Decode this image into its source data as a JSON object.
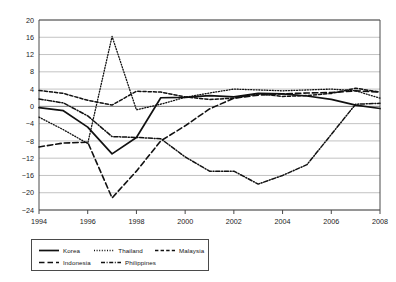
{
  "chart_data": {
    "type": "line",
    "title": "",
    "subtitle": "",
    "xlabel": "",
    "ylabel": "",
    "xlim": [
      1994,
      2008
    ],
    "ylim": [
      -24,
      20
    ],
    "grid": true,
    "legend_position": "bottom-left",
    "x": [
      1994,
      1995,
      1996,
      1997,
      1998,
      1999,
      2000,
      2001,
      2002,
      2003,
      2004,
      2005,
      2006,
      2007,
      2008
    ],
    "xticks": [
      "1994",
      "1996",
      "1998",
      "2000",
      "2002",
      "2004",
      "2006",
      "2008"
    ],
    "yticks": [
      "20",
      "16",
      "12",
      "8",
      "4",
      "0",
      "-4",
      "-8",
      "-12",
      "-16",
      "-20",
      "-24"
    ],
    "series": [
      {
        "name": "Korea",
        "style": "solid",
        "values": [
          -0.3,
          -1.0,
          -4.8,
          -11.0,
          -7.2,
          2.0,
          2.1,
          2.5,
          2.2,
          3.0,
          2.9,
          2.4,
          1.6,
          0.3,
          -0.5
        ]
      },
      {
        "name": "Thailand",
        "style": "dotted",
        "values": [
          -2.5,
          -5.4,
          -8.6,
          16.2,
          -0.8,
          0.5,
          2.1,
          3.1,
          4.0,
          3.8,
          3.6,
          3.8,
          4.0,
          3.6,
          1.9
        ]
      },
      {
        "name": "Malaysia",
        "style": "dashed",
        "values": [
          3.7,
          3.0,
          1.4,
          0.3,
          3.5,
          3.3,
          2.2,
          1.6,
          1.9,
          2.9,
          2.3,
          2.5,
          3.0,
          4.2,
          3.3
        ]
      },
      {
        "name": "Indonesia",
        "style": "long-dash",
        "values": [
          -9.4,
          -8.5,
          -8.3,
          -21.2,
          -15.0,
          -8.0,
          -4.5,
          -0.6,
          1.9,
          2.6,
          2.9,
          3.1,
          3.2,
          3.6,
          3.3
        ]
      },
      {
        "name": "Philippines",
        "style": "dash-dot",
        "values": [
          1.7,
          0.8,
          -2.2,
          -7.0,
          -7.2,
          -7.5,
          -11.7,
          -15.0,
          -15.0,
          -18.0,
          -16.0,
          -13.5,
          -6.5,
          0.5,
          0.7
        ]
      }
    ]
  },
  "legend": {
    "items": [
      {
        "label": "Korea",
        "style": "solid"
      },
      {
        "label": "Thailand",
        "style": "dotted"
      },
      {
        "label": "Malaysia",
        "style": "dashed"
      },
      {
        "label": "Indonesia",
        "style": "long-dash"
      },
      {
        "label": "Philippines",
        "style": "dash-dot"
      }
    ]
  },
  "colors": {
    "line": "#111111",
    "grid": "#b4b4b4",
    "axis": "#4a4a4a",
    "text": "#161616",
    "background": "#ffffff"
  }
}
